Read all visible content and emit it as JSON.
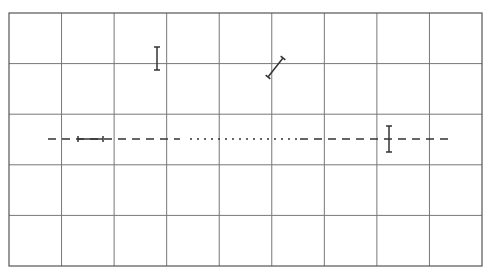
{
  "diagram": {
    "background": "#ffffff",
    "grid": {
      "x": 9,
      "y": 13,
      "width": 473,
      "height": 253,
      "columns": 9,
      "rows": 5,
      "line_color": "#777777",
      "border_color": "#555555"
    },
    "dashed_line": {
      "y": 139,
      "segments": [
        {
          "style": "dashed",
          "x1": 48,
          "x2": 180
        },
        {
          "style": "dotted",
          "x1": 190,
          "x2": 300
        },
        {
          "style": "dashed",
          "x1": 300,
          "x2": 452
        }
      ],
      "color": "#333333"
    },
    "markers": [
      {
        "name": "vertical-error-bar-top",
        "type": "vertical",
        "x": 157,
        "y1": 47,
        "y2": 70
      },
      {
        "name": "diagonal-error-bar",
        "type": "diagonal",
        "x1": 268,
        "y1": 77,
        "x2": 283,
        "y2": 58
      },
      {
        "name": "horizontal-error-bar",
        "type": "horizontal",
        "y": 139,
        "x1": 78,
        "x2": 103
      },
      {
        "name": "vertical-error-bar-right",
        "type": "vertical",
        "x": 389,
        "y1": 126,
        "y2": 152
      }
    ]
  }
}
